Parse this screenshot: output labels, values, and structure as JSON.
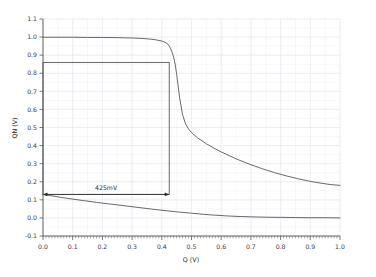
{
  "chart_data": {
    "type": "line",
    "title": "",
    "subtitle": "",
    "xlabel": "Q (V)",
    "ylabel": "QN (V)",
    "xlim": [
      0.0,
      1.0
    ],
    "ylim": [
      -0.1,
      1.1
    ],
    "grid": true,
    "legend": "none",
    "xticks": [
      0.0,
      0.1,
      0.2,
      0.3,
      0.4,
      0.5,
      0.6,
      0.7,
      0.8,
      0.9,
      1.0
    ],
    "xtick_labels": [
      "0.0",
      "0.1",
      "0.2",
      "0.3",
      "0.4",
      "0.5",
      "0.6",
      "0.7",
      "0.8",
      "0.9",
      "1.0"
    ],
    "yticks": [
      -0.1,
      0.0,
      0.1,
      0.2,
      0.3,
      0.4,
      0.5,
      0.6,
      0.7,
      0.8,
      0.9,
      1.0,
      1.1
    ],
    "ytick_labels": [
      "-0.1",
      "0.0",
      "0.1",
      "0.2",
      "0.3",
      "0.4",
      "0.5",
      "0.6",
      "0.7",
      "0.8",
      "0.9",
      "1.0",
      "1.1"
    ],
    "minor_xticks": true,
    "series": [
      {
        "name": "vtc-upper",
        "color": "#4d4d4d",
        "x": [
          0.0,
          0.05,
          0.1,
          0.15,
          0.2,
          0.25,
          0.3,
          0.33,
          0.36,
          0.38,
          0.4,
          0.41,
          0.42,
          0.425,
          0.43,
          0.435,
          0.44,
          0.445,
          0.45,
          0.455,
          0.46,
          0.47,
          0.48,
          0.49,
          0.5,
          0.52,
          0.55,
          0.58,
          0.6,
          0.63,
          0.66,
          0.7,
          0.74,
          0.78,
          0.82,
          0.86,
          0.9,
          0.94,
          0.97,
          1.0
        ],
        "y": [
          0.999,
          0.999,
          0.999,
          0.998,
          0.998,
          0.997,
          0.995,
          0.993,
          0.989,
          0.985,
          0.978,
          0.972,
          0.962,
          0.95,
          0.935,
          0.915,
          0.888,
          0.85,
          0.795,
          0.73,
          0.665,
          0.57,
          0.52,
          0.492,
          0.472,
          0.443,
          0.41,
          0.382,
          0.365,
          0.342,
          0.32,
          0.294,
          0.271,
          0.25,
          0.232,
          0.216,
          0.202,
          0.191,
          0.184,
          0.18
        ]
      },
      {
        "name": "vtc-lower",
        "color": "#4d4d4d",
        "x": [
          0.0,
          0.03,
          0.06,
          0.1,
          0.14,
          0.18,
          0.22,
          0.26,
          0.3,
          0.34,
          0.38,
          0.42,
          0.46,
          0.5,
          0.54,
          0.58,
          0.62,
          0.66,
          0.7,
          0.75,
          0.8,
          0.85,
          0.9,
          0.95,
          1.0
        ],
        "y": [
          0.13,
          0.122,
          0.114,
          0.104,
          0.095,
          0.086,
          0.078,
          0.07,
          0.062,
          0.054,
          0.046,
          0.039,
          0.032,
          0.026,
          0.02,
          0.015,
          0.011,
          0.008,
          0.006,
          0.004,
          0.003,
          0.002,
          0.001,
          0.001,
          0.0
        ]
      }
    ],
    "annotations": [
      {
        "type": "rect",
        "name": "noise-margin-square",
        "x0": 0.0,
        "y0": 0.13,
        "x1": 0.425,
        "y1": 0.86,
        "color": "#4d4d4d"
      },
      {
        "type": "double-arrow",
        "name": "snm-measure-arrow",
        "x0": 0.0,
        "x1": 0.425,
        "y": 0.13,
        "label": "425mV",
        "color": "#2b2b2b"
      }
    ]
  }
}
